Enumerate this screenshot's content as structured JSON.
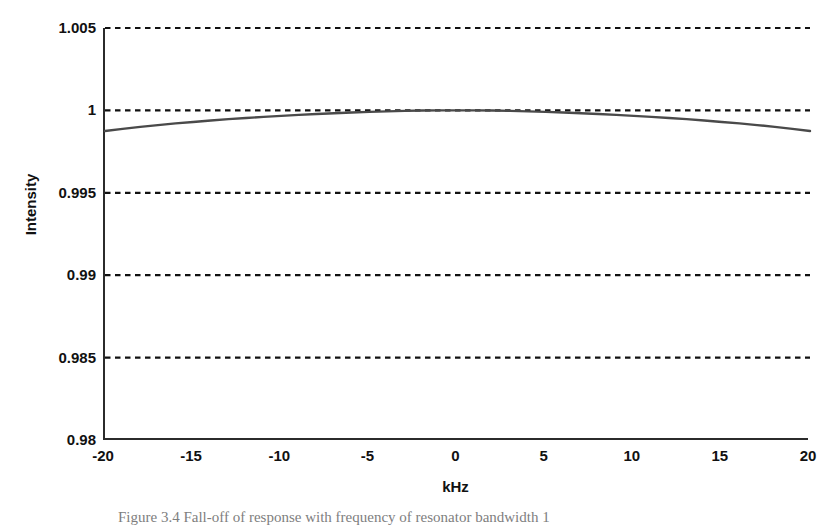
{
  "figure": {
    "caption": "Figure 3.4   Fall-off of response with frequency of resonator bandwidth 1",
    "caption_label": "Figure 3.4"
  },
  "axes": {
    "y_title": "Intensity",
    "x_title": "kHz",
    "y_ticks": [
      "1.005",
      "1",
      "0.995",
      "0.99",
      "0.985",
      "0.98"
    ],
    "x_ticks": [
      "-20",
      "-15",
      "-10",
      "-5",
      "0",
      "5",
      "10",
      "15",
      "20"
    ]
  },
  "style": {
    "gridline_color": "#111111",
    "curve_color": "#4a4a4a",
    "axis_color": "#2b2b2b",
    "background": "#ffffff"
  },
  "chart_data": {
    "type": "line",
    "title": "",
    "subtitle": "",
    "xlabel": "kHz",
    "ylabel": "Intensity",
    "xlim": [
      -20,
      20
    ],
    "ylim": [
      0.98,
      1.005
    ],
    "xticks": [
      -20,
      -15,
      -10,
      -5,
      0,
      5,
      10,
      15,
      20
    ],
    "yticks": [
      0.98,
      0.985,
      0.99,
      0.995,
      1,
      1.005
    ],
    "grid": "horizontal-dashed",
    "legend": "none",
    "series": [
      {
        "name": "Resonator response",
        "x": [
          -20,
          -19,
          -18,
          -17,
          -16,
          -15,
          -14,
          -13,
          -12,
          -11,
          -10,
          -9,
          -8,
          -7,
          -6,
          -5,
          -4,
          -3,
          -2,
          -1,
          0,
          1,
          2,
          3,
          4,
          5,
          6,
          7,
          8,
          9,
          10,
          11,
          12,
          13,
          14,
          15,
          16,
          17,
          18,
          19,
          20
        ],
        "y": [
          0.99875,
          0.99888,
          0.999,
          0.99911,
          0.99921,
          0.9993,
          0.99939,
          0.99947,
          0.99954,
          0.99961,
          0.99967,
          0.99973,
          0.99978,
          0.99983,
          0.99987,
          0.99991,
          0.99994,
          0.99997,
          0.99999,
          1.0,
          1.0,
          1.0,
          0.99999,
          0.99997,
          0.99994,
          0.99991,
          0.99987,
          0.99983,
          0.99978,
          0.99973,
          0.99967,
          0.99961,
          0.99954,
          0.99947,
          0.99939,
          0.9993,
          0.99921,
          0.99911,
          0.999,
          0.99888,
          0.99875
        ]
      }
    ]
  }
}
